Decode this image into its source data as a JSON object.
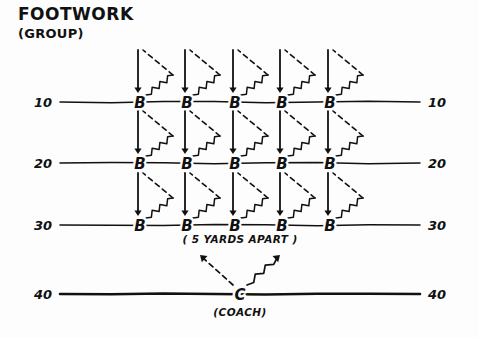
{
  "diagram": {
    "title": "FOOTWORK",
    "subtitle": "(GROUP)",
    "spacing_note": "( 5 YARDS APART )",
    "coach_label": "(COACH)",
    "coach_marker": "C",
    "player_marker": "B",
    "ink_color": "#111111",
    "background_color": "#fdfdfd"
  },
  "yard_lines": [
    {
      "label": "10",
      "y": 102,
      "bold": false,
      "players": 5
    },
    {
      "label": "20",
      "y": 163,
      "bold": false,
      "players": 5
    },
    {
      "label": "30",
      "y": 225,
      "bold": false,
      "players": 5
    },
    {
      "label": "40",
      "y": 294,
      "bold": true,
      "players": 0
    }
  ],
  "left_labels": [
    "10",
    "20",
    "30",
    "40"
  ],
  "right_labels": [
    "10",
    "20",
    "30",
    "40"
  ],
  "player_columns_x": [
    140,
    187,
    235,
    282,
    330
  ],
  "player_rows": [
    {
      "yard": "10",
      "markers": [
        "B",
        "B",
        "B",
        "B",
        "B"
      ]
    },
    {
      "yard": "20",
      "markers": [
        "B",
        "B",
        "B",
        "B",
        "B"
      ]
    },
    {
      "yard": "30",
      "markers": [
        "B",
        "B",
        "B",
        "B",
        "B"
      ]
    }
  ],
  "coach": {
    "marker": "C",
    "label": "(COACH)",
    "x": 240,
    "y": 294,
    "left_arrow_style": "dashed",
    "right_arrow_style": "zigzag"
  },
  "legend_movement": {
    "down_arrow": "solid",
    "out_path": "zigzag",
    "return_path": "dashed"
  }
}
